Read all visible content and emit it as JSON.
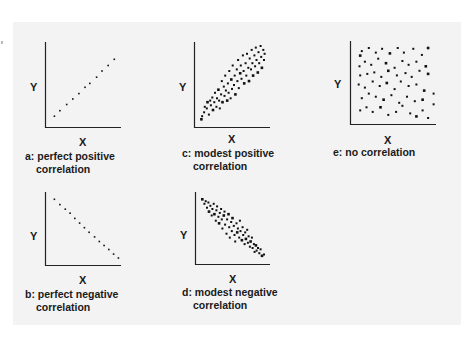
{
  "figure": {
    "background_color": "#f3f3f3",
    "dot_color": "#111111",
    "axis_color": "#222222",
    "axis_x_label": "X",
    "axis_y_label": "Y"
  },
  "panels": [
    {
      "id": "a",
      "caption_line1": "a: perfect positive",
      "caption_line2": "correlation",
      "x_label": "X",
      "y_label": "Y"
    },
    {
      "id": "b",
      "caption_line1": "b: perfect negative",
      "caption_line2": "correlation",
      "x_label": "X",
      "y_label": "Y"
    },
    {
      "id": "c",
      "caption_line1": "c: modest positive",
      "caption_line2": "correlation",
      "x_label": "X",
      "y_label": "Y"
    },
    {
      "id": "d",
      "caption_line1": "d: modest negative",
      "caption_line2": "correlation",
      "x_label": "X",
      "y_label": "Y"
    },
    {
      "id": "e",
      "caption_line1": "e: no correlation",
      "caption_line2": "",
      "x_label": "X",
      "y_label": "Y"
    }
  ],
  "chart_data": [
    {
      "type": "scatter",
      "title": "a: perfect positive correlation",
      "xlabel": "X",
      "ylabel": "Y",
      "grid": false,
      "points": [
        [
          0.08,
          0.1
        ],
        [
          0.16,
          0.17
        ],
        [
          0.26,
          0.25
        ],
        [
          0.35,
          0.32
        ],
        [
          0.44,
          0.39
        ],
        [
          0.53,
          0.47
        ],
        [
          0.6,
          0.52
        ],
        [
          0.7,
          0.6
        ],
        [
          0.78,
          0.68
        ],
        [
          0.87,
          0.75
        ],
        [
          0.96,
          0.83
        ]
      ]
    },
    {
      "type": "scatter",
      "title": "b: perfect negative correlation",
      "xlabel": "X",
      "ylabel": "Y",
      "grid": false,
      "points": [
        [
          0.08,
          0.95
        ],
        [
          0.16,
          0.87
        ],
        [
          0.24,
          0.8
        ],
        [
          0.31,
          0.74
        ],
        [
          0.38,
          0.66
        ],
        [
          0.45,
          0.59
        ],
        [
          0.52,
          0.52
        ],
        [
          0.59,
          0.45
        ],
        [
          0.67,
          0.38
        ],
        [
          0.74,
          0.31
        ],
        [
          0.81,
          0.25
        ],
        [
          0.88,
          0.19
        ],
        [
          0.95,
          0.12
        ],
        [
          1.02,
          0.06
        ]
      ]
    },
    {
      "type": "scatter",
      "title": "c: modest positive correlation",
      "xlabel": "X",
      "ylabel": "Y",
      "grid": false,
      "points": [
        [
          0.05,
          0.06
        ],
        [
          0.06,
          0.1
        ],
        [
          0.09,
          0.15
        ],
        [
          0.1,
          0.22
        ],
        [
          0.13,
          0.2
        ],
        [
          0.14,
          0.28
        ],
        [
          0.16,
          0.12
        ],
        [
          0.18,
          0.3
        ],
        [
          0.19,
          0.24
        ],
        [
          0.21,
          0.34
        ],
        [
          0.22,
          0.18
        ],
        [
          0.24,
          0.28
        ],
        [
          0.25,
          0.4
        ],
        [
          0.27,
          0.22
        ],
        [
          0.28,
          0.33
        ],
        [
          0.3,
          0.44
        ],
        [
          0.31,
          0.3
        ],
        [
          0.32,
          0.2
        ],
        [
          0.34,
          0.38
        ],
        [
          0.35,
          0.55
        ],
        [
          0.36,
          0.28
        ],
        [
          0.38,
          0.48
        ],
        [
          0.39,
          0.36
        ],
        [
          0.4,
          0.62
        ],
        [
          0.41,
          0.43
        ],
        [
          0.43,
          0.3
        ],
        [
          0.44,
          0.52
        ],
        [
          0.45,
          0.4
        ],
        [
          0.46,
          0.68
        ],
        [
          0.48,
          0.33
        ],
        [
          0.49,
          0.57
        ],
        [
          0.5,
          0.45
        ],
        [
          0.51,
          0.75
        ],
        [
          0.53,
          0.5
        ],
        [
          0.54,
          0.62
        ],
        [
          0.55,
          0.38
        ],
        [
          0.57,
          0.7
        ],
        [
          0.58,
          0.55
        ],
        [
          0.59,
          0.82
        ],
        [
          0.6,
          0.46
        ],
        [
          0.62,
          0.65
        ],
        [
          0.63,
          0.75
        ],
        [
          0.64,
          0.58
        ],
        [
          0.66,
          0.88
        ],
        [
          0.67,
          0.68
        ],
        [
          0.68,
          0.52
        ],
        [
          0.7,
          0.78
        ],
        [
          0.71,
          0.62
        ],
        [
          0.72,
          0.9
        ],
        [
          0.74,
          0.72
        ],
        [
          0.75,
          0.55
        ],
        [
          0.76,
          0.84
        ],
        [
          0.78,
          0.7
        ],
        [
          0.79,
          0.95
        ],
        [
          0.8,
          0.78
        ],
        [
          0.81,
          0.62
        ],
        [
          0.83,
          0.88
        ],
        [
          0.84,
          0.74
        ],
        [
          0.85,
          0.98
        ],
        [
          0.86,
          0.82
        ],
        [
          0.88,
          0.66
        ],
        [
          0.89,
          0.92
        ],
        [
          0.9,
          0.78
        ],
        [
          0.92,
          1.0
        ],
        [
          0.93,
          0.86
        ],
        [
          0.94,
          0.72
        ],
        [
          0.96,
          0.95
        ],
        [
          0.97,
          0.82
        ],
        [
          0.98,
          0.9
        ]
      ]
    },
    {
      "type": "scatter",
      "title": "d: modest negative correlation",
      "xlabel": "X",
      "ylabel": "Y",
      "grid": false,
      "points": [
        [
          0.05,
          0.95
        ],
        [
          0.08,
          0.88
        ],
        [
          0.1,
          0.92
        ],
        [
          0.12,
          0.82
        ],
        [
          0.14,
          0.9
        ],
        [
          0.15,
          0.76
        ],
        [
          0.17,
          0.85
        ],
        [
          0.19,
          0.7
        ],
        [
          0.2,
          0.8
        ],
        [
          0.22,
          0.88
        ],
        [
          0.23,
          0.72
        ],
        [
          0.25,
          0.62
        ],
        [
          0.26,
          0.78
        ],
        [
          0.27,
          0.84
        ],
        [
          0.29,
          0.68
        ],
        [
          0.3,
          0.58
        ],
        [
          0.31,
          0.74
        ],
        [
          0.33,
          0.8
        ],
        [
          0.34,
          0.64
        ],
        [
          0.35,
          0.5
        ],
        [
          0.37,
          0.7
        ],
        [
          0.38,
          0.76
        ],
        [
          0.39,
          0.56
        ],
        [
          0.41,
          0.42
        ],
        [
          0.42,
          0.64
        ],
        [
          0.44,
          0.72
        ],
        [
          0.45,
          0.52
        ],
        [
          0.46,
          0.36
        ],
        [
          0.48,
          0.6
        ],
        [
          0.49,
          0.46
        ],
        [
          0.5,
          0.66
        ],
        [
          0.52,
          0.54
        ],
        [
          0.53,
          0.4
        ],
        [
          0.54,
          0.3
        ],
        [
          0.56,
          0.58
        ],
        [
          0.57,
          0.44
        ],
        [
          0.58,
          0.5
        ],
        [
          0.6,
          0.36
        ],
        [
          0.61,
          0.62
        ],
        [
          0.62,
          0.46
        ],
        [
          0.64,
          0.32
        ],
        [
          0.65,
          0.52
        ],
        [
          0.66,
          0.4
        ],
        [
          0.68,
          0.26
        ],
        [
          0.69,
          0.44
        ],
        [
          0.7,
          0.34
        ],
        [
          0.72,
          0.48
        ],
        [
          0.73,
          0.28
        ],
        [
          0.74,
          0.38
        ],
        [
          0.76,
          0.22
        ],
        [
          0.77,
          0.3
        ],
        [
          0.79,
          0.36
        ],
        [
          0.8,
          0.2
        ],
        [
          0.82,
          0.26
        ],
        [
          0.83,
          0.14
        ],
        [
          0.85,
          0.24
        ],
        [
          0.86,
          0.16
        ],
        [
          0.88,
          0.2
        ],
        [
          0.9,
          0.12
        ],
        [
          0.92,
          0.18
        ],
        [
          0.94,
          0.08
        ],
        [
          0.97,
          0.1
        ]
      ]
    },
    {
      "type": "scatter",
      "title": "e: no correlation",
      "xlabel": "X",
      "ylabel": "Y",
      "grid": false,
      "points": [
        [
          0.08,
          0.86
        ],
        [
          0.1,
          0.92
        ],
        [
          0.19,
          0.96
        ],
        [
          0.28,
          0.9
        ],
        [
          0.36,
          0.95
        ],
        [
          0.46,
          0.89
        ],
        [
          0.56,
          0.96
        ],
        [
          0.64,
          0.9
        ],
        [
          0.76,
          0.95
        ],
        [
          0.87,
          0.87
        ],
        [
          0.95,
          0.96
        ],
        [
          0.07,
          0.72
        ],
        [
          0.14,
          0.78
        ],
        [
          0.22,
          0.74
        ],
        [
          0.31,
          0.82
        ],
        [
          0.41,
          0.76
        ],
        [
          0.52,
          0.7
        ],
        [
          0.62,
          0.79
        ],
        [
          0.7,
          0.74
        ],
        [
          0.8,
          0.78
        ],
        [
          0.92,
          0.72
        ],
        [
          0.08,
          0.6
        ],
        [
          0.17,
          0.62
        ],
        [
          0.26,
          0.64
        ],
        [
          0.35,
          0.58
        ],
        [
          0.44,
          0.66
        ],
        [
          0.55,
          0.6
        ],
        [
          0.66,
          0.63
        ],
        [
          0.74,
          0.58
        ],
        [
          0.84,
          0.66
        ],
        [
          0.95,
          0.62
        ],
        [
          0.06,
          0.48
        ],
        [
          0.14,
          0.44
        ],
        [
          0.24,
          0.52
        ],
        [
          0.33,
          0.46
        ],
        [
          0.42,
          0.5
        ],
        [
          0.52,
          0.42
        ],
        [
          0.6,
          0.52
        ],
        [
          0.7,
          0.46
        ],
        [
          0.8,
          0.48
        ],
        [
          0.9,
          0.4
        ],
        [
          1.02,
          0.36
        ],
        [
          0.1,
          0.3
        ],
        [
          0.19,
          0.36
        ],
        [
          0.28,
          0.32
        ],
        [
          0.38,
          0.28
        ],
        [
          0.48,
          0.34
        ],
        [
          0.58,
          0.24
        ],
        [
          0.68,
          0.32
        ],
        [
          0.78,
          0.26
        ],
        [
          0.88,
          0.28
        ],
        [
          1.02,
          0.22
        ],
        [
          0.08,
          0.14
        ],
        [
          0.16,
          0.18
        ],
        [
          0.24,
          0.12
        ],
        [
          0.34,
          0.18
        ],
        [
          0.44,
          0.08
        ],
        [
          0.54,
          0.12
        ],
        [
          0.62,
          0.2
        ],
        [
          0.72,
          0.1
        ],
        [
          0.8,
          0.06
        ],
        [
          0.88,
          0.14
        ],
        [
          0.95,
          0.04
        ]
      ]
    }
  ]
}
